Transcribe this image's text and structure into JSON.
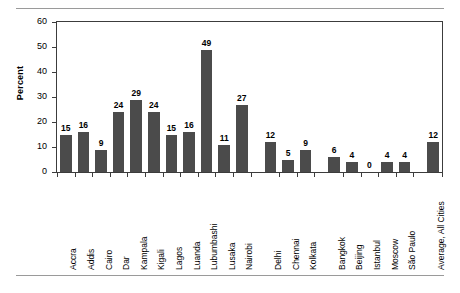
{
  "chart_data": {
    "type": "bar",
    "title": "",
    "xlabel": "",
    "ylabel": "Percent",
    "ylim": [
      0,
      60
    ],
    "yticks": [
      0,
      10,
      20,
      30,
      40,
      50,
      60
    ],
    "grid": false,
    "legend": "none",
    "bar_color": "#4b4b4b",
    "categories": [
      "Accra",
      "Addis",
      "Cairo",
      "Dar",
      "Kampala",
      "Kigali",
      "Lagos",
      "Luanda",
      "Lubumbashi",
      "Lusaka",
      "Nairobi",
      "Delhi",
      "Chennai",
      "Kolkata",
      "Bangkok",
      "Beijing",
      "Istanbul",
      "Moscow",
      "São Paulo",
      "Average, All Cities"
    ],
    "values": [
      15,
      16,
      9,
      24,
      29,
      24,
      15,
      16,
      49,
      11,
      27,
      12,
      5,
      9,
      6,
      4,
      0,
      4,
      4,
      12
    ],
    "value_labels": [
      "15",
      "16",
      "9",
      "24",
      "29",
      "24",
      "15",
      "16",
      "49",
      "11",
      "27",
      "12",
      "5",
      "9",
      "6",
      "4",
      "0",
      "4",
      "4",
      "12"
    ],
    "groups": [
      {
        "name": "African cities",
        "start": 0,
        "end": 10
      },
      {
        "name": "Indian cities",
        "start": 11,
        "end": 13
      },
      {
        "name": "Other cities",
        "start": 14,
        "end": 18
      },
      {
        "name": "Average",
        "start": 19,
        "end": 19
      }
    ]
  }
}
